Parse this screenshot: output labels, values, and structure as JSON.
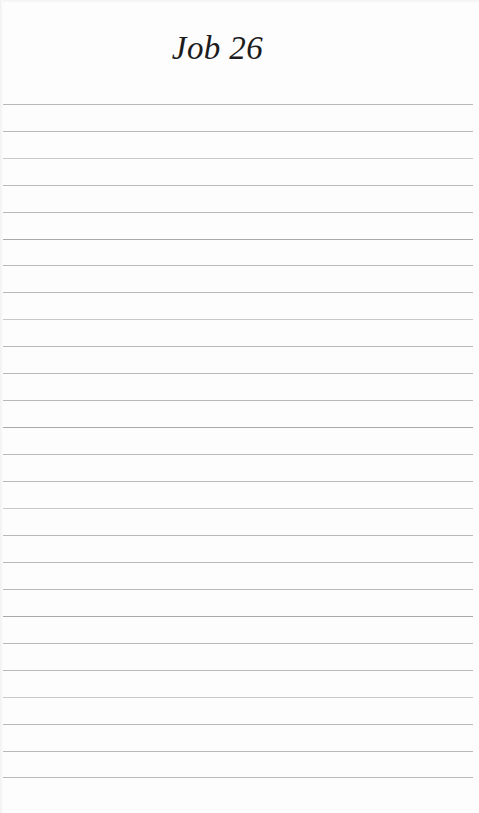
{
  "document": {
    "type": "ruled-notebook-page",
    "title": "Job 26",
    "background_color": "#fdfdfd",
    "title_color": "#1c1c1e",
    "rule_color": "#b9b9b9"
  },
  "heading": {
    "title": "Job 26"
  },
  "ruled_area": {
    "line_count": 26,
    "first_line_y": 104,
    "line_spacing": 26.9,
    "line_left": 3,
    "line_right": 473,
    "lines": [
      {
        "y": 104,
        "weight": "normal"
      },
      {
        "y": 131,
        "weight": "normal"
      },
      {
        "y": 158,
        "weight": "light"
      },
      {
        "y": 185,
        "weight": "normal"
      },
      {
        "y": 212,
        "weight": "normal"
      },
      {
        "y": 239,
        "weight": "dark"
      },
      {
        "y": 265,
        "weight": "normal"
      },
      {
        "y": 292,
        "weight": "normal"
      },
      {
        "y": 319,
        "weight": "light"
      },
      {
        "y": 346,
        "weight": "normal"
      },
      {
        "y": 373,
        "weight": "normal"
      },
      {
        "y": 400,
        "weight": "normal"
      },
      {
        "y": 427,
        "weight": "dark"
      },
      {
        "y": 454,
        "weight": "normal"
      },
      {
        "y": 481,
        "weight": "normal"
      },
      {
        "y": 508,
        "weight": "light"
      },
      {
        "y": 535,
        "weight": "normal"
      },
      {
        "y": 562,
        "weight": "normal"
      },
      {
        "y": 589,
        "weight": "normal"
      },
      {
        "y": 616,
        "weight": "dark"
      },
      {
        "y": 643,
        "weight": "normal"
      },
      {
        "y": 670,
        "weight": "normal"
      },
      {
        "y": 697,
        "weight": "light"
      },
      {
        "y": 724,
        "weight": "normal"
      },
      {
        "y": 751,
        "weight": "normal"
      },
      {
        "y": 777,
        "weight": "normal"
      }
    ]
  }
}
